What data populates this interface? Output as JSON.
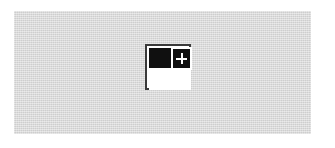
{
  "canvas": {
    "width": 335,
    "height": 148,
    "background_color": "#ffffff"
  },
  "panel": {
    "name": "image-placeholder-panel",
    "fill_color": "#d9d9d9",
    "texture": "fine-noise",
    "left": 14,
    "top": 11,
    "width": 297,
    "height": 123
  },
  "icon": {
    "semantic_name": "add-image-icon",
    "description": "add-new-image badge",
    "left": 145,
    "top": 44,
    "size": 46,
    "frame_border_color": "#3a3a3a",
    "frame_fill_color": "#ffffff",
    "block_color": "#101010",
    "badge": {
      "name": "plus-badge",
      "fill_color": "#101010",
      "border_color": "#ffffff",
      "glyph": "plus",
      "glyph_color": "#ffffff"
    }
  }
}
